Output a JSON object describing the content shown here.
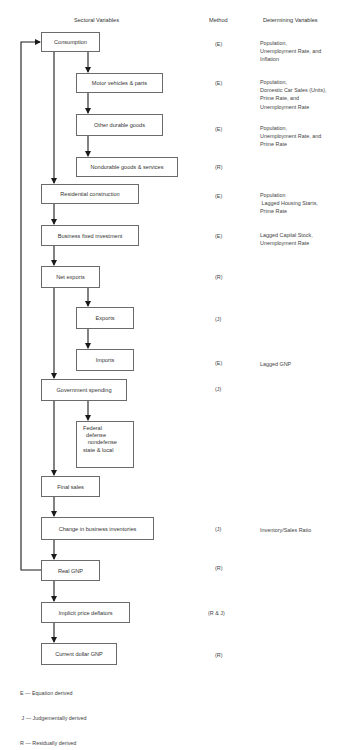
{
  "headers": {
    "sectoral": "Sectoral Variables",
    "method": "Method",
    "determining": "Determining Variables"
  },
  "nodes": [
    {
      "id": "consumption",
      "label": "Consumption",
      "method": "(E)",
      "determining": "Population,\nUnemployment Rate, and\nInflation",
      "box": [
        41,
        32,
        59,
        20
      ],
      "method_y": 41,
      "det_y": 39
    },
    {
      "id": "motor-vehicles",
      "label": "Motor vehicles & parts",
      "method": "(E)",
      "determining": "Population,\nDomestic Car Sales (Units),\nPrime Rate, and\nUnemployment Rate",
      "box": [
        76,
        73,
        87,
        20
      ],
      "method_y": 80,
      "det_y": 78
    },
    {
      "id": "other-durable",
      "label": "Other durable goods",
      "method": "(E)",
      "determining": "Population,\nUnemployment Rate, and\nPrime Rate",
      "box": [
        76,
        114,
        87,
        22
      ],
      "method_y": 126,
      "det_y": 124
    },
    {
      "id": "nondurable",
      "label": "Nondurable goods & services",
      "method": "(R)",
      "determining": "",
      "box": [
        76,
        157,
        102,
        20
      ],
      "method_y": 164,
      "det_y": 164
    },
    {
      "id": "residential",
      "label": "Residential construction",
      "method": "(E)",
      "determining": "Population\n Lagged Housing Starts,\nPrime Rate",
      "box": [
        41,
        184,
        98,
        20
      ],
      "method_y": 193,
      "det_y": 191
    },
    {
      "id": "business-fixed",
      "label": "Business fixed investment",
      "method": "(E)",
      "determining": "Lagged Capital Stock,\nUnemployment Rate",
      "box": [
        41,
        225,
        98,
        21
      ],
      "method_y": 233,
      "det_y": 231
    },
    {
      "id": "net-exports",
      "label": "Net exports",
      "method": "(R)",
      "determining": "",
      "box": [
        41,
        266,
        59,
        22
      ],
      "method_y": 274,
      "det_y": 274
    },
    {
      "id": "exports",
      "label": "Exports",
      "method": "(J)",
      "determining": "",
      "box": [
        76,
        307,
        58,
        22
      ],
      "method_y": 316,
      "det_y": 316
    },
    {
      "id": "imports",
      "label": "Imports",
      "method": "(E)",
      "determining": "Lagged GNP",
      "box": [
        76,
        349,
        58,
        22
      ],
      "method_y": 360,
      "det_y": 360
    },
    {
      "id": "government",
      "label": "Government spending",
      "method": "(J)",
      "determining": "",
      "box": [
        41,
        379,
        86,
        22
      ],
      "method_y": 386,
      "det_y": 386
    },
    {
      "id": "federal",
      "label": "Federal\n  defense\n   nondefense\nstate & local",
      "method": "",
      "determining": "",
      "box": [
        76,
        421,
        58,
        47
      ],
      "multi": true,
      "method_y": 0,
      "det_y": 0
    },
    {
      "id": "final-sales",
      "label": "Final sales",
      "method": "",
      "determining": "",
      "box": [
        41,
        476,
        59,
        21
      ],
      "method_y": 0,
      "det_y": 0
    },
    {
      "id": "inventories",
      "label": "Change in business inventories",
      "method": "(J)",
      "determining": "Inventory/Sales Ratio",
      "box": [
        41,
        517,
        113,
        23
      ],
      "method_y": 526,
      "det_y": 526
    },
    {
      "id": "real-gnp",
      "label": "Real GNP",
      "method": "(R)",
      "determining": "",
      "box": [
        41,
        560,
        59,
        21
      ],
      "method_y": 565,
      "det_y": 565
    },
    {
      "id": "price-deflators",
      "label": "Implicit price deflators",
      "method": "(R & J)",
      "determining": "",
      "box": [
        41,
        602,
        89,
        21
      ],
      "method_y": 610,
      "det_y": 610
    },
    {
      "id": "current-gnp",
      "label": "Current dollar GNP",
      "method": "(R)",
      "determining": "",
      "box": [
        41,
        643,
        76,
        22
      ],
      "method_y": 652,
      "det_y": 652
    }
  ],
  "legend": {
    "lines": [
      "E — Equation derived",
      " J — Judgementally derived",
      "R — Residually derived"
    ]
  },
  "colors": {
    "line": "#1a1a1a",
    "box_border": "#6a6a6a",
    "text": "#333333"
  }
}
